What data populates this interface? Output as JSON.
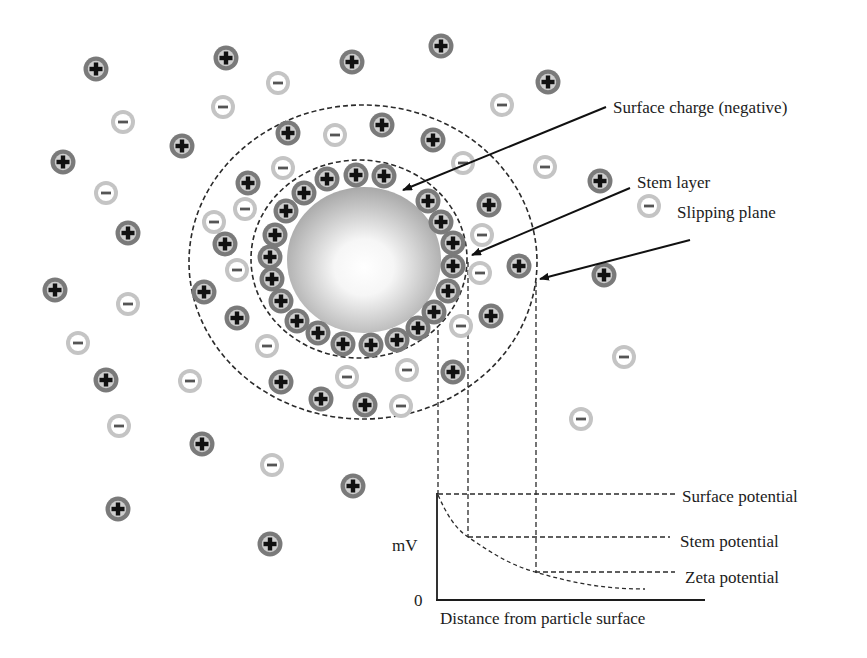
{
  "colors": {
    "background": "#ffffff",
    "cation_ring": "#7a7a7a",
    "cation_fill": "#cfcfcf",
    "cation_sign": "#111111",
    "anion_ring": "#c4c4c4",
    "anion_fill": "#ffffff",
    "anion_sign": "#555555",
    "dashed_line": "#2a2a2a",
    "arrow": "#111111",
    "particle_edge": "#a9a9a9",
    "particle_center": "#ffffff"
  },
  "particle": {
    "cx": 364,
    "cy": 260,
    "rx": 77,
    "ry": 73
  },
  "stern_boundary": {
    "cx": 359,
    "cy": 259,
    "rx": 108,
    "ry": 99
  },
  "slipping_plane": {
    "cx": 363,
    "cy": 262,
    "rx": 174,
    "ry": 157
  },
  "labels": {
    "surface_charge": "Surface charge (negative)",
    "stem_layer": "Stem layer",
    "slipping_plane": "Slipping plane"
  },
  "annotations": [
    {
      "id": "surface_charge",
      "text": "Surface charge (negative)",
      "text_x": 613,
      "text_y": 113,
      "from": [
        606,
        107
      ],
      "to": [
        403,
        190
      ]
    },
    {
      "id": "stem_layer",
      "text": "Stem layer",
      "text_x": 637,
      "text_y": 188,
      "from": [
        630,
        188
      ],
      "to": [
        472,
        255
      ]
    },
    {
      "id": "slipping_plane",
      "text": "Slipping plane",
      "text_x": 677,
      "text_y": 218,
      "from": [
        690,
        240
      ],
      "to": [
        540,
        279
      ]
    }
  ],
  "ion_symbols": {
    "cation": "+",
    "anion": "−"
  },
  "ions": {
    "stern_cations": [
      [
        327,
        179
      ],
      [
        356,
        175
      ],
      [
        384,
        176
      ],
      [
        304,
        193
      ],
      [
        286,
        211
      ],
      [
        275,
        235
      ],
      [
        270,
        257
      ],
      [
        272,
        279
      ],
      [
        281,
        301
      ],
      [
        297,
        321
      ],
      [
        318,
        333
      ],
      [
        343,
        344
      ],
      [
        371,
        345
      ],
      [
        397,
        340
      ],
      [
        418,
        328
      ],
      [
        434,
        312
      ],
      [
        448,
        291
      ],
      [
        453,
        266
      ],
      [
        453,
        243
      ],
      [
        441,
        222
      ],
      [
        428,
        201
      ]
    ],
    "cations": [
      [
        96,
        69
      ],
      [
        182,
        146
      ],
      [
        63,
        162
      ],
      [
        128,
        233
      ],
      [
        226,
        58
      ],
      [
        288,
        133
      ],
      [
        248,
        183
      ],
      [
        352,
        62
      ],
      [
        441,
        46
      ],
      [
        548,
        82
      ],
      [
        382,
        125
      ],
      [
        433,
        140
      ],
      [
        489,
        205
      ],
      [
        600,
        181
      ],
      [
        55,
        290
      ],
      [
        106,
        380
      ],
      [
        202,
        444
      ],
      [
        118,
        509
      ],
      [
        270,
        544
      ],
      [
        225,
        244
      ],
      [
        204,
        292
      ],
      [
        237,
        318
      ],
      [
        281,
        382
      ],
      [
        453,
        372
      ],
      [
        321,
        399
      ],
      [
        365,
        405
      ],
      [
        491,
        316
      ],
      [
        353,
        486
      ],
      [
        519,
        266
      ],
      [
        604,
        275
      ]
    ],
    "anions": [
      [
        123,
        122
      ],
      [
        106,
        193
      ],
      [
        223,
        107
      ],
      [
        278,
        83
      ],
      [
        283,
        168
      ],
      [
        245,
        209
      ],
      [
        214,
        222
      ],
      [
        502,
        105
      ],
      [
        335,
        135
      ],
      [
        463,
        163
      ],
      [
        545,
        167
      ],
      [
        649,
        206
      ],
      [
        482,
        235
      ],
      [
        128,
        304
      ],
      [
        78,
        343
      ],
      [
        190,
        381
      ],
      [
        119,
        426
      ],
      [
        272,
        465
      ],
      [
        237,
        270
      ],
      [
        267,
        346
      ],
      [
        347,
        377
      ],
      [
        407,
        370
      ],
      [
        401,
        406
      ],
      [
        461,
        326
      ],
      [
        480,
        273
      ],
      [
        624,
        357
      ],
      [
        581,
        419
      ]
    ]
  },
  "chart_data": {
    "type": "line",
    "title": "",
    "xlabel": "Distance from particle surface",
    "ylabel": "mV",
    "y_origin_label": "0",
    "grid": false,
    "series": [
      {
        "name": "Potential decay",
        "style": "dashed",
        "x": [
          0,
          30,
          97,
          206
        ],
        "y": [
          106,
          63,
          28,
          10
        ]
      }
    ],
    "reference_levels": [
      {
        "name": "Surface potential",
        "value": 106,
        "x_start": 0
      },
      {
        "name": "Stem potential",
        "value": 63,
        "x_start": 30
      },
      {
        "name": "Zeta potential",
        "value": 28,
        "x_start": 97
      }
    ],
    "axes_px": {
      "x0": 437,
      "y0": 600,
      "x_end": 705,
      "y_top": 493
    }
  },
  "graph": {
    "y_axis_label": "mV",
    "origin_label": "0",
    "x_axis_label": "Distance from particle surface",
    "levels": [
      {
        "label": "Surface potential",
        "y": 494,
        "x_start": 438,
        "x_end": 677,
        "text_x": 682,
        "text_y": 502
      },
      {
        "label": "Stem potential",
        "y": 537,
        "x_start": 468,
        "x_end": 670,
        "text_x": 680,
        "text_y": 547
      },
      {
        "label": "Zeta potential",
        "y": 572,
        "x_start": 535,
        "x_end": 675,
        "text_x": 685,
        "text_y": 583
      }
    ],
    "drop_lines": [
      {
        "x": 438,
        "y_top": 330,
        "y_bottom": 494
      },
      {
        "x": 468,
        "y_top": 262,
        "y_bottom": 537
      },
      {
        "x": 536,
        "y_top": 282,
        "y_bottom": 572
      }
    ]
  }
}
